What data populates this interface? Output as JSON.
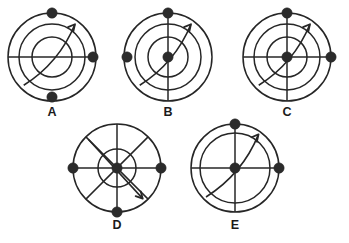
{
  "figure": {
    "background_color": "#ffffff",
    "stroke_color": "#262626",
    "dot_color": "#2b2b2b",
    "width": 349,
    "height": 243,
    "diagrams": [
      {
        "id": "A",
        "label": "A",
        "center": {
          "x": 52,
          "y": 57
        },
        "label_pos": {
          "x": 52,
          "y": 106
        },
        "circles": [
          44,
          33,
          20
        ],
        "lines": [
          "horizontal"
        ],
        "arrow": {
          "from_angle": 225,
          "to_angle": 55,
          "radius": 40,
          "direction": "clockwise"
        },
        "dots": [
          {
            "name": "top-dot",
            "angle": 90,
            "radius": 44
          },
          {
            "name": "right-dot",
            "angle": 0,
            "radius": 41
          },
          {
            "name": "bottom-dot",
            "angle": 270,
            "radius": 40
          }
        ]
      },
      {
        "id": "B",
        "label": "B",
        "center": {
          "x": 168,
          "y": 57
        },
        "label_pos": {
          "x": 168,
          "y": 106
        },
        "circles": [
          44,
          33,
          20
        ],
        "lines": [
          "vertical"
        ],
        "arrow": {
          "from_angle": 225,
          "to_angle": 55,
          "radius": 40,
          "direction": "clockwise"
        },
        "dots": [
          {
            "name": "top-dot",
            "angle": 90,
            "radius": 44
          },
          {
            "name": "left-dot",
            "angle": 180,
            "radius": 41
          },
          {
            "name": "center-dot",
            "angle": 0,
            "radius": 0
          }
        ]
      },
      {
        "id": "C",
        "label": "C",
        "center": {
          "x": 287,
          "y": 57
        },
        "label_pos": {
          "x": 287,
          "y": 106
        },
        "circles": [
          44,
          33,
          20
        ],
        "lines": [
          "horizontal",
          "vertical"
        ],
        "arrow": {
          "from_angle": 225,
          "to_angle": 55,
          "radius": 40,
          "direction": "clockwise"
        },
        "dots": [
          {
            "name": "top-dot",
            "angle": 90,
            "radius": 44
          },
          {
            "name": "right-dot",
            "angle": 0,
            "radius": 44
          },
          {
            "name": "center-dot",
            "angle": 0,
            "radius": 0
          }
        ]
      },
      {
        "id": "D",
        "label": "D",
        "center": {
          "x": 117,
          "y": 168
        },
        "label_pos": {
          "x": 117,
          "y": 219
        },
        "circles": [
          44,
          19
        ],
        "lines": [
          "horizontal",
          "vertical",
          "diagonal-nw-se",
          "diagonal-ne-sw"
        ],
        "arrow": {
          "from_angle": 135,
          "to_angle": 310,
          "radius": 40,
          "direction": "clockwise",
          "straight": true
        },
        "dots": [
          {
            "name": "left-dot",
            "angle": 180,
            "radius": 44
          },
          {
            "name": "right-dot",
            "angle": 0,
            "radius": 44
          },
          {
            "name": "center-dot",
            "angle": 0,
            "radius": 0
          },
          {
            "name": "bottom-dot",
            "angle": 270,
            "radius": 44
          }
        ]
      },
      {
        "id": "E",
        "label": "E",
        "center": {
          "x": 235,
          "y": 168
        },
        "label_pos": {
          "x": 235,
          "y": 219
        },
        "circles": [
          44,
          35
        ],
        "lines": [
          "horizontal",
          "vertical"
        ],
        "arrow": {
          "from_angle": 225,
          "to_angle": 55,
          "radius": 41,
          "direction": "clockwise"
        },
        "dots": [
          {
            "name": "top-dot",
            "angle": 90,
            "radius": 44
          },
          {
            "name": "right-dot",
            "angle": 0,
            "radius": 44
          },
          {
            "name": "center-dot",
            "angle": 0,
            "radius": 0
          }
        ]
      }
    ]
  }
}
